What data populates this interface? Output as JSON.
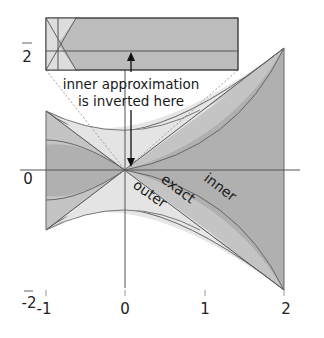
{
  "diagram": {
    "annotation": {
      "line1": "inner approximation",
      "line2": "is inverted here"
    },
    "region_labels": {
      "outer": "outer",
      "exact": "exact",
      "inner": "inner"
    },
    "x_ticks": [
      "-1",
      "0",
      "1",
      "2"
    ],
    "y_ticks": [
      "2",
      "0",
      "-2"
    ],
    "colors": {
      "outer_fill": "#e6e6e6",
      "exact_fill": "#c8c8c8",
      "inner_fill": "#b3b3b3",
      "inset_fill": "#bdbdbd",
      "inset_left_fill": "#dcdcdc",
      "axis": "#555555",
      "curve": "#666666"
    }
  }
}
